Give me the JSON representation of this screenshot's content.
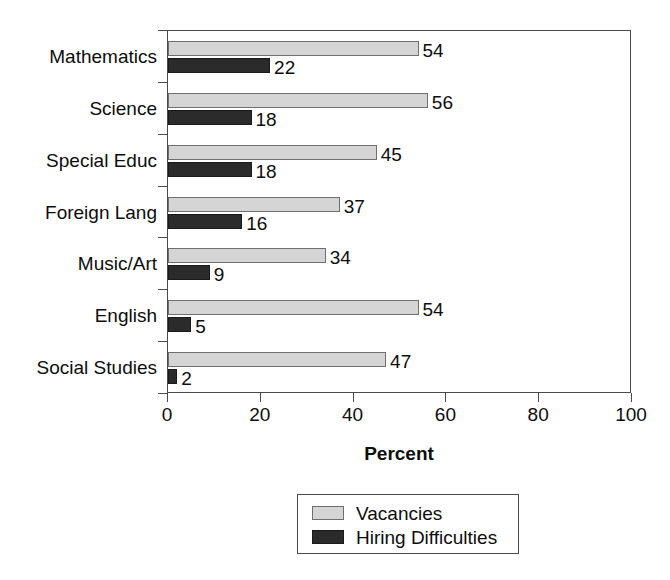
{
  "chart_data": {
    "type": "bar",
    "orientation": "horizontal",
    "title": "",
    "xlabel": "Percent",
    "ylabel": "",
    "xlim": [
      0,
      100
    ],
    "xticks": [
      0,
      20,
      40,
      60,
      80,
      100
    ],
    "xtick_labels": [
      "0",
      "20",
      "40",
      "60",
      "80",
      "100"
    ],
    "grid": false,
    "legend_position": "bottom-center",
    "categories": [
      "Mathematics",
      "Science",
      "Special Educ",
      "Foreign Lang",
      "Music/Art",
      "English",
      "Social Studies"
    ],
    "series": [
      {
        "name": "Vacancies",
        "color": "#d5d5d5",
        "values": [
          54,
          56,
          45,
          37,
          34,
          54,
          47
        ],
        "labels": [
          "54",
          "56",
          "45",
          "37",
          "34",
          "54",
          "47"
        ]
      },
      {
        "name": "Hiring Difficulties",
        "color": "#2b2b2b",
        "values": [
          22,
          18,
          18,
          16,
          9,
          5,
          2
        ],
        "labels": [
          "22",
          "18",
          "18",
          "16",
          "9",
          "5",
          "2"
        ]
      }
    ]
  },
  "legend": {
    "entries": [
      {
        "label": "Vacancies",
        "swatch": "light-gray-swatch"
      },
      {
        "label": "Hiring Difficulties",
        "swatch": "dark-swatch"
      }
    ]
  },
  "axis": {
    "x_title": "Percent"
  },
  "colors": {
    "vacancies": "#d5d5d5",
    "hiring_difficulties": "#2b2b2b",
    "axis_line": "#4a4a4a",
    "text": "#0d0d0d",
    "background": "#ffffff"
  }
}
